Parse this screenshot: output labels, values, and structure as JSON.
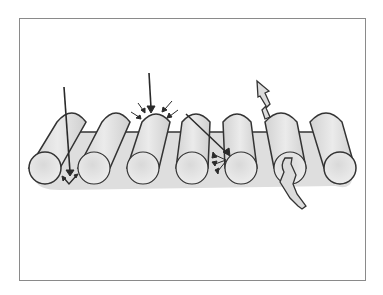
{
  "figure": {
    "type": "illustration",
    "colors": {
      "background": "#ffffff",
      "frame": "#8a8a8a",
      "cylinder_fill": "#e4e4e4",
      "cylinder_shade": "#c9c9c9",
      "outline": "#333333",
      "arrow": "#2a2a2a"
    },
    "cylinders": [
      {
        "id": 1,
        "end_cx": 45,
        "end_cy": 168,
        "top_x": 72
      },
      {
        "id": 2,
        "end_cx": 94,
        "end_cy": 168,
        "top_x": 116
      },
      {
        "id": 3,
        "end_cx": 143,
        "end_cy": 168,
        "top_x": 156
      },
      {
        "id": 4,
        "end_cx": 192,
        "end_cy": 168,
        "top_x": 196
      },
      {
        "id": 5,
        "end_cx": 241,
        "end_cy": 168,
        "top_x": 237
      },
      {
        "id": 6,
        "end_cx": 290,
        "end_cy": 168,
        "top_x": 281
      },
      {
        "id": 7,
        "end_cx": 340,
        "end_cy": 168,
        "top_x": 326
      }
    ],
    "rays": [
      {
        "name": "ray-transmitted-through-gap",
        "description": "long vertical arrow passing between fibers, splits at bottom"
      },
      {
        "name": "ray-incident-top",
        "description": "vertical arrow hitting top of fiber with small converging arrows"
      },
      {
        "name": "ray-scattered",
        "description": "diagonal arrow entering fiber with scattered arrowheads"
      },
      {
        "name": "ray-reflected-up",
        "description": "jagged arrow exiting upward from a fiber"
      }
    ]
  }
}
